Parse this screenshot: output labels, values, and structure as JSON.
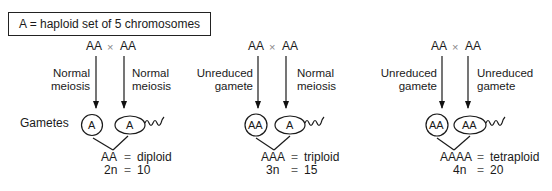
{
  "legend": {
    "text": "A = haploid set of 5 chromosomes"
  },
  "row_label": "Gametes",
  "panels": [
    {
      "parents": {
        "left": "AA",
        "cross": "×",
        "right": "AA"
      },
      "left_label": [
        "Normal",
        "meiosis"
      ],
      "right_label": [
        "Normal",
        "meiosis"
      ],
      "egg": "A",
      "sperm": "A",
      "result": {
        "genotype": "AA",
        "eq": "=",
        "ploidy": "diploid",
        "formula": "2n",
        "count": "10"
      }
    },
    {
      "parents": {
        "left": "AA",
        "cross": "×",
        "right": "AA"
      },
      "left_label": [
        "Unreduced",
        "gamete"
      ],
      "right_label": [
        "Normal",
        "meiosis"
      ],
      "egg": "AA",
      "sperm": "A",
      "result": {
        "genotype": "AAA",
        "eq": "=",
        "ploidy": "triploid",
        "formula": "3n",
        "count": "15"
      }
    },
    {
      "parents": {
        "left": "AA",
        "cross": "×",
        "right": "AA"
      },
      "left_label": [
        "Unreduced",
        "gamete"
      ],
      "right_label": [
        "Unreduced",
        "gamete"
      ],
      "egg": "AA",
      "sperm": "AA",
      "result": {
        "genotype": "AAAA",
        "eq": "=",
        "ploidy": "tetraploid",
        "formula": "4n",
        "count": "20"
      }
    }
  ]
}
